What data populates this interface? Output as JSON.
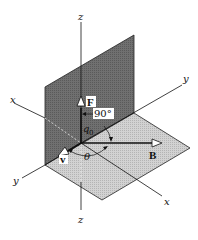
{
  "diagram": {
    "type": "3d-vector-geometry",
    "axes": {
      "z_top": "z",
      "z_bottom": "z",
      "x_left": "x",
      "x_right": "x",
      "y_left": "y",
      "y_right": "y"
    },
    "vectors": {
      "force": "F",
      "velocity": "v",
      "field": "B"
    },
    "angles": {
      "right_angle": "90°",
      "q0_label": "q",
      "q0_sub": "0",
      "theta": "θ"
    },
    "colors": {
      "vertical_plane": "#6e6e6e",
      "horizontal_plane": "#c8c8c8",
      "lines": "#111111",
      "background": "#ffffff"
    }
  }
}
